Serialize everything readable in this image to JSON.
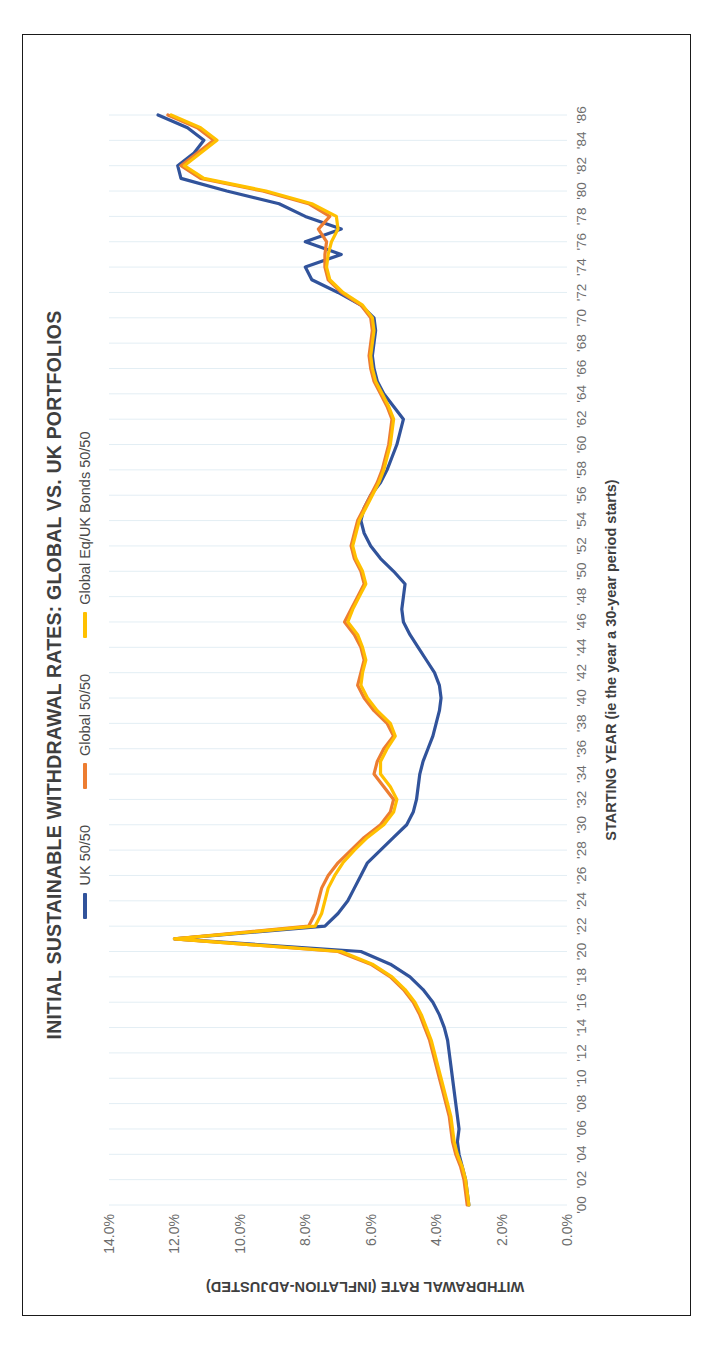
{
  "chart_data": {
    "type": "line",
    "title": "INITIAL SUSTAINABLE WITHDRAWAL RATES: GLOBAL VS. UK PORTFOLIOS",
    "xlabel": "STARTING YEAR (ie the year a 30-year period starts)",
    "ylabel": "WITHDRAWAL RATE (INFLATION-ADJUSTED)",
    "grid": true,
    "legend_position": "top-center",
    "ylim": [
      0,
      14
    ],
    "ytick_labels": [
      "0.0%",
      "2.0%",
      "4.0%",
      "6.0%",
      "8.0%",
      "10.0%",
      "12.0%",
      "14.0%"
    ],
    "ytick_values": [
      0,
      2,
      4,
      6,
      8,
      10,
      12,
      14
    ],
    "xtick_labels": [
      "'00",
      "'02",
      "'04",
      "'06",
      "'08",
      "'10",
      "'12",
      "'14",
      "'16",
      "'18",
      "'20",
      "'22",
      "'24",
      "'26",
      "'28",
      "'30",
      "'32",
      "'34",
      "'36",
      "'38",
      "'40",
      "'42",
      "'44",
      "'46",
      "'48",
      "'50",
      "'52",
      "'54",
      "'56",
      "'58",
      "'60",
      "'62",
      "'64",
      "'66",
      "'68",
      "'70",
      "'72",
      "'74",
      "'76",
      "'78",
      "'80",
      "'82",
      "'84",
      "'86"
    ],
    "x": [
      1900,
      1901,
      1902,
      1903,
      1904,
      1905,
      1906,
      1907,
      1908,
      1909,
      1910,
      1911,
      1912,
      1913,
      1914,
      1915,
      1916,
      1917,
      1918,
      1919,
      1920,
      1921,
      1922,
      1923,
      1924,
      1925,
      1926,
      1927,
      1928,
      1929,
      1930,
      1931,
      1932,
      1933,
      1934,
      1935,
      1936,
      1937,
      1938,
      1939,
      1940,
      1941,
      1942,
      1943,
      1944,
      1945,
      1946,
      1947,
      1948,
      1949,
      1950,
      1951,
      1952,
      1953,
      1954,
      1955,
      1956,
      1957,
      1958,
      1959,
      1960,
      1961,
      1962,
      1963,
      1964,
      1965,
      1966,
      1967,
      1968,
      1969,
      1970,
      1971,
      1972,
      1973,
      1974,
      1975,
      1976,
      1977,
      1978,
      1979,
      1980,
      1981,
      1982,
      1983,
      1984,
      1985,
      1986
    ],
    "series": [
      {
        "name": "UK 50/50",
        "color": "#31539B",
        "values": [
          3.0,
          3.05,
          3.1,
          3.2,
          3.3,
          3.35,
          3.3,
          3.35,
          3.4,
          3.45,
          3.5,
          3.55,
          3.6,
          3.65,
          3.75,
          3.9,
          4.1,
          4.4,
          4.8,
          5.4,
          6.3,
          12.0,
          7.4,
          7.0,
          6.7,
          6.5,
          6.3,
          6.1,
          5.7,
          5.3,
          4.9,
          4.7,
          4.6,
          4.55,
          4.5,
          4.4,
          4.25,
          4.1,
          4.0,
          3.9,
          3.85,
          3.9,
          4.05,
          4.3,
          4.55,
          4.8,
          5.0,
          5.05,
          5.0,
          4.95,
          5.3,
          5.7,
          6.0,
          6.2,
          6.3,
          6.2,
          6.0,
          5.7,
          5.5,
          5.35,
          5.2,
          5.1,
          5.0,
          5.3,
          5.6,
          5.8,
          5.9,
          5.95,
          5.9,
          5.85,
          5.9,
          6.3,
          7.0,
          7.8,
          8.0,
          6.9,
          8.0,
          6.9,
          8.0,
          8.8,
          10.4,
          11.8,
          11.9,
          11.4,
          11.1,
          11.6,
          12.5
        ]
      },
      {
        "name": "Global 50/50",
        "color": "#ED7D31",
        "values": [
          3.05,
          3.1,
          3.15,
          3.25,
          3.4,
          3.5,
          3.55,
          3.6,
          3.7,
          3.8,
          3.9,
          4.0,
          4.1,
          4.2,
          4.35,
          4.5,
          4.7,
          5.0,
          5.4,
          6.0,
          7.0,
          12.0,
          7.9,
          7.7,
          7.6,
          7.5,
          7.3,
          7.0,
          6.6,
          6.2,
          5.7,
          5.4,
          5.3,
          5.6,
          5.9,
          5.8,
          5.6,
          5.3,
          5.5,
          5.9,
          6.2,
          6.4,
          6.3,
          6.2,
          6.3,
          6.5,
          6.8,
          6.6,
          6.4,
          6.2,
          6.3,
          6.5,
          6.6,
          6.5,
          6.4,
          6.2,
          6.0,
          5.8,
          5.65,
          5.55,
          5.45,
          5.4,
          5.35,
          5.5,
          5.7,
          5.9,
          6.0,
          6.05,
          6.0,
          5.95,
          6.0,
          6.3,
          6.9,
          7.3,
          7.4,
          7.4,
          7.35,
          7.6,
          7.25,
          7.9,
          9.3,
          11.2,
          11.8,
          11.3,
          10.8,
          11.3,
          12.2
        ]
      },
      {
        "name": "Global Eq/UK Bonds 50/50",
        "color": "#FFC000",
        "values": [
          3.0,
          3.05,
          3.1,
          3.2,
          3.35,
          3.45,
          3.5,
          3.55,
          3.65,
          3.75,
          3.85,
          3.95,
          4.05,
          4.15,
          4.3,
          4.45,
          4.65,
          4.95,
          5.35,
          5.95,
          6.9,
          12.0,
          7.7,
          7.5,
          7.4,
          7.3,
          7.1,
          6.85,
          6.5,
          6.1,
          5.6,
          5.3,
          5.2,
          5.4,
          5.7,
          5.7,
          5.5,
          5.25,
          5.4,
          5.8,
          6.1,
          6.3,
          6.25,
          6.15,
          6.25,
          6.4,
          6.7,
          6.55,
          6.35,
          6.15,
          6.25,
          6.45,
          6.55,
          6.45,
          6.35,
          6.15,
          5.95,
          5.75,
          5.6,
          5.5,
          5.4,
          5.35,
          5.3,
          5.45,
          5.65,
          5.85,
          5.95,
          6.0,
          5.95,
          5.9,
          5.95,
          6.25,
          6.85,
          7.25,
          7.35,
          7.3,
          7.2,
          7.0,
          7.05,
          7.8,
          9.2,
          11.1,
          11.7,
          11.2,
          10.7,
          11.2,
          12.1
        ]
      }
    ]
  },
  "colors": {
    "uk": "#31539B",
    "global": "#ED7D31",
    "global_eq_uk_bonds": "#FFC000",
    "grid": "#e3eef4",
    "text": "#6d6d6d",
    "title": "#3f3f3f",
    "frame": "#1a1a1a"
  }
}
